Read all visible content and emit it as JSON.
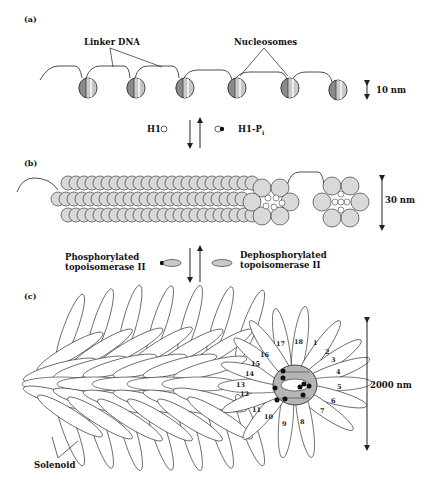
{
  "figure": {
    "panels": [
      {
        "id": "a",
        "label": "(a)",
        "annotations": [
          "Linker DNA",
          "Nucleosomes"
        ],
        "scale": "10 nm",
        "nucleosome_count": 6
      },
      {
        "id": "b",
        "label": "(b)",
        "scale": "30 nm"
      },
      {
        "id": "c",
        "label": "(c)",
        "annotation": "Solenoid",
        "scale": "2000 nm",
        "loop_numbers": [
          "1",
          "2",
          "3",
          "4",
          "5",
          "6",
          "7",
          "8",
          "9",
          "10",
          "11",
          "12",
          "13",
          "14",
          "15",
          "16",
          "17",
          "18"
        ]
      }
    ],
    "transition_ab": {
      "left": "H1",
      "right": "H1-P",
      "right_subscript": "i"
    },
    "transition_bc": {
      "left_line1": "Phosphorylated",
      "left_line2": "topoisomerase II",
      "right_line1": "Dephosphorylated",
      "right_line2": "topoisomerase II"
    }
  },
  "colors": {
    "stroke": "#222222",
    "nucleosome_fill": "#c8c8c8",
    "dark_fill": "#8a8a8a",
    "bead_fill": "#d9d9d9",
    "scaffold_fill": "#b5b5b5"
  }
}
